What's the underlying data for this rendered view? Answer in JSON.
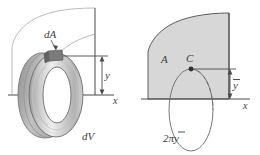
{
  "figure": {
    "background_color": "#ffffff",
    "line_color": "#4a4a4a",
    "fill_color": "#d7d7d7",
    "left_panel": {
      "name": "differential-volume-of-revolution",
      "labels": {
        "dA": "dA",
        "dV": "dV",
        "y": "y",
        "x": "x"
      }
    },
    "right_panel": {
      "name": "centroid-path-of-revolution",
      "labels": {
        "A": "A",
        "C": "C",
        "y_bar": "y",
        "x": "x",
        "circumference": "2πy"
      }
    }
  }
}
